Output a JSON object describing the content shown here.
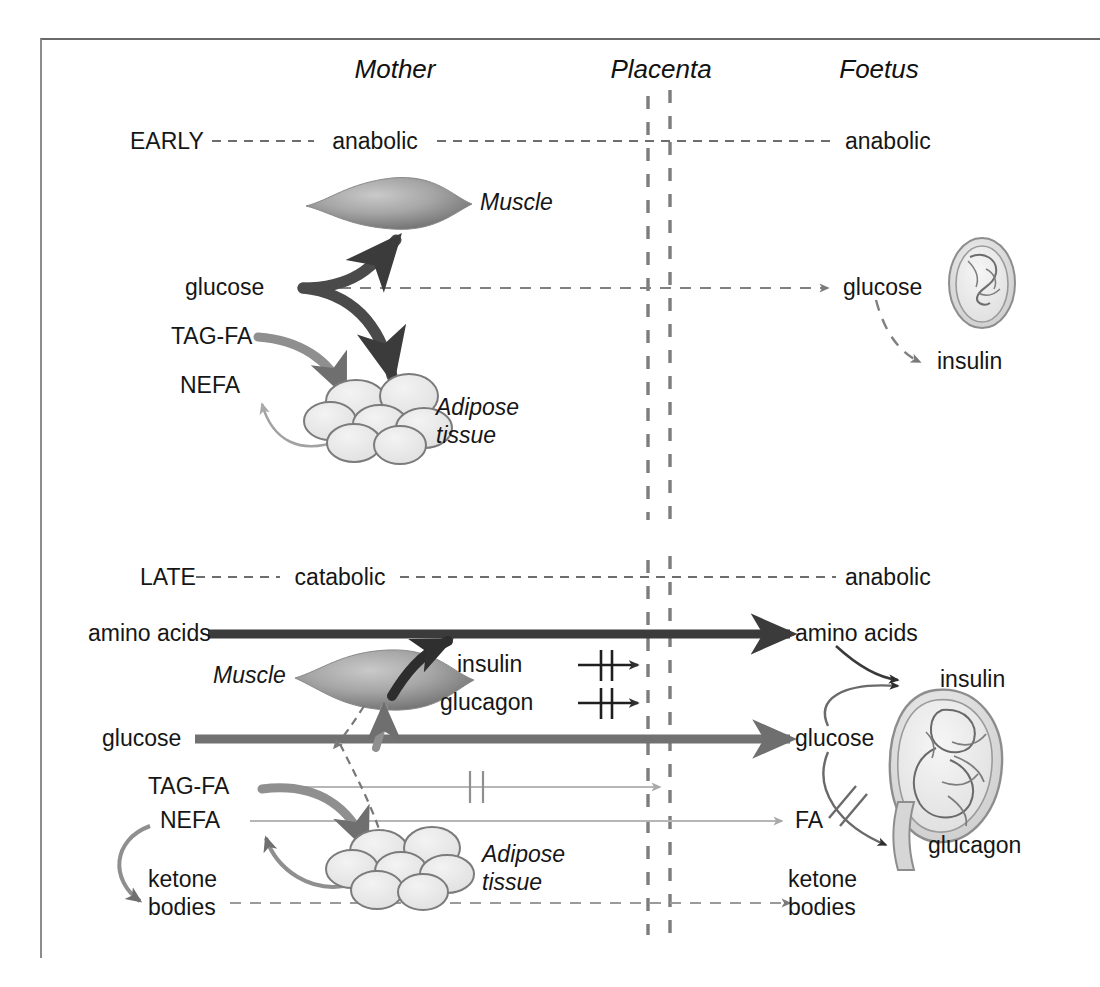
{
  "figure": {
    "title_columns": [
      {
        "key": "mother",
        "label": "Mother"
      },
      {
        "key": "placenta",
        "label": "Placenta"
      },
      {
        "key": "foetus",
        "label": "Foetus"
      }
    ],
    "colors": {
      "dark_arrow": "#3b3b3b",
      "mid_arrow": "#6f6f6f",
      "light_arrow": "#a9a9a9",
      "dashed": "#808080",
      "placenta_line": "#7d7d7d",
      "tissue_fill": "#e8e8e8",
      "tissue_stroke": "#7b7b7b",
      "muscle_fill": "#9a9a9a",
      "border": "#6a6a6a"
    }
  },
  "early": {
    "stage_label": "EARLY",
    "mother_state": "anabolic",
    "foetus_state": "anabolic",
    "mother": {
      "glucose": "glucose",
      "tag_fa": "TAG-FA",
      "nefa": "NEFA",
      "muscle": "Muscle",
      "adipose_line1": "Adipose",
      "adipose_line2": "tissue"
    },
    "foetus": {
      "glucose": "glucose",
      "insulin": "insulin"
    }
  },
  "late": {
    "stage_label": "LATE",
    "mother_state": "catabolic",
    "foetus_state": "anabolic",
    "mother": {
      "amino_acids": "amino acids",
      "glucose": "glucose",
      "tag_fa": "TAG-FA",
      "nefa": "NEFA",
      "ketone_line1": "ketone",
      "ketone_line2": "bodies",
      "muscle": "Muscle",
      "adipose_line1": "Adipose",
      "adipose_line2": "tissue"
    },
    "blocked": {
      "insulin": "insulin",
      "glucagon": "glucagon"
    },
    "foetus": {
      "amino_acids": "amino acids",
      "glucose": "glucose",
      "fa": "FA",
      "ketone_line1": "ketone",
      "ketone_line2": "bodies",
      "insulin": "insulin",
      "glucagon": "glucagon"
    }
  }
}
